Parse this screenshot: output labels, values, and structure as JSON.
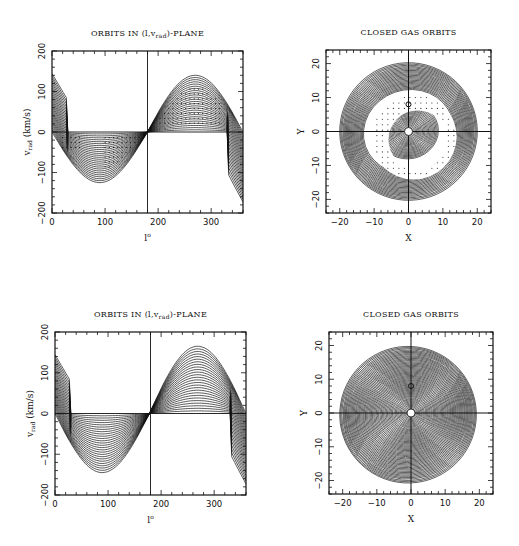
{
  "figure": {
    "panels": 4,
    "layout": "2x2"
  },
  "chart_data": [
    {
      "id": "top-left",
      "type": "line",
      "title": "ORBITS IN (l,v_rad)-PLANE",
      "title_main": "ORBITS IN (l,v",
      "title_sub": "rad",
      "title_end": ")-PLANE",
      "xlabel": "l°",
      "xlabel_main": "l",
      "xlabel_sup": "o",
      "ylabel_main": "v",
      "ylabel_sub": "rad",
      "ylabel_unit": "(km/s)",
      "xlim": [
        0,
        360
      ],
      "ylim": [
        -200,
        200
      ],
      "xticks": [
        0,
        100,
        200,
        300
      ],
      "yticks": [
        -200,
        -100,
        0,
        100,
        200
      ],
      "reference_lines": {
        "vertical_x": 180,
        "horizontal_y": 0
      },
      "series_count": 26,
      "envelope": {
        "min_at_l": 100,
        "min_v": -125,
        "max_at_l": 275,
        "max_v": 140,
        "zero_cross_l": 180
      },
      "dotted_regions": true,
      "description": "family of nested sinusoid-like orbit curves with gap (dotted) regions"
    },
    {
      "id": "top-right",
      "type": "scatter",
      "title": "CLOSED GAS ORBITS",
      "xlabel": "X",
      "ylabel": "Y",
      "xlim": [
        -24,
        24
      ],
      "ylim": [
        -24,
        24
      ],
      "xticks": [
        -20,
        -10,
        0,
        10,
        20
      ],
      "yticks": [
        -20,
        -10,
        0,
        10,
        20
      ],
      "outer_radius": 20,
      "gap_ring": {
        "inner_radius": 8.5,
        "outer_radius": 12.5,
        "offset_x": 1.5,
        "offset_y": -1.5
      },
      "markers": [
        {
          "x": 0,
          "y": 0,
          "kind": "open-circle"
        },
        {
          "x": 0,
          "y": 8,
          "kind": "small-circle"
        }
      ],
      "ring_count": 60
    },
    {
      "id": "bottom-left",
      "type": "line",
      "title": "ORBITS IN (l,v_rad)-PLANE",
      "title_main": "ORBITS IN (l,v",
      "title_sub": "rad",
      "title_end": ")-PLANE",
      "xlabel": "l°",
      "xlabel_main": "l",
      "xlabel_sup": "o",
      "ylabel_main": "v",
      "ylabel_sub": "rad",
      "ylabel_unit": "(km/s)",
      "xlim": [
        0,
        360
      ],
      "ylim": [
        -200,
        200
      ],
      "xticks": [
        0,
        100,
        200,
        300
      ],
      "yticks": [
        -200,
        -100,
        0,
        100,
        200
      ],
      "reference_lines": {
        "vertical_x": 180,
        "horizontal_y": 0
      },
      "series_count": 26,
      "envelope": {
        "min_at_l": 105,
        "min_v": -145,
        "max_at_l": 282,
        "max_v": 165,
        "zero_cross_l": 178
      },
      "dotted_regions": false
    },
    {
      "id": "bottom-right",
      "type": "scatter",
      "title": "CLOSED GAS ORBITS",
      "xlabel": "X",
      "ylabel": "Y",
      "xlim": [
        -24,
        24
      ],
      "ylim": [
        -24,
        24
      ],
      "xticks": [
        -20,
        -10,
        0,
        10,
        20
      ],
      "yticks": [
        -20,
        -10,
        0,
        10,
        20
      ],
      "outer_radius": 20,
      "markers": [
        {
          "x": 0,
          "y": 0,
          "kind": "open-circle"
        },
        {
          "x": 0,
          "y": 8,
          "kind": "small-circle"
        }
      ],
      "ring_count": 60
    }
  ]
}
